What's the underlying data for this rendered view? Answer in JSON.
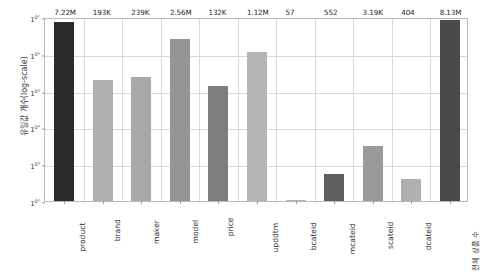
{
  "chart_data": {
    "type": "bar",
    "title": "",
    "xlabel": "",
    "ylabel": "유일값 개수(log-scale)",
    "yscale": "log",
    "ylim": [
      100,
      10000000
    ],
    "grid": true,
    "legend": null,
    "ytick_labels": [
      "10⁷",
      "10⁶",
      "10⁵",
      "10⁴",
      "10³",
      "10²"
    ],
    "ytick_values": [
      10000000,
      1000000,
      100000,
      10000,
      1000,
      100
    ],
    "categories": [
      "product",
      "brand",
      "maker",
      "model",
      "price",
      "upddtm",
      "bcateid",
      "mcateid",
      "scateid",
      "dcateid",
      "전체 상품 수"
    ],
    "values": [
      7220000,
      193000,
      239000,
      2560000,
      132000,
      1120000,
      57,
      552,
      3190,
      404,
      8130000
    ],
    "data_labels": [
      "7.22M",
      "193K",
      "239K",
      "2.56M",
      "132K",
      "1.12M",
      "57",
      "552",
      "3.19K",
      "404",
      "8.13M"
    ],
    "bar_colors": [
      "#2b2b2b",
      "#b0b0b0",
      "#a8a8a8",
      "#969696",
      "#7e7e7e",
      "#b5b5b5",
      "#b2b2b2",
      "#5e5e5e",
      "#9a9a9a",
      "#b0b0b0",
      "#4a4a4a"
    ]
  },
  "colors": {
    "background": "#ffffff",
    "axis_frame": "#b9b9b9",
    "gridline": "#d8d8d8",
    "tick_text": "#3c3c3c",
    "label_text": "#1e1e1e"
  }
}
